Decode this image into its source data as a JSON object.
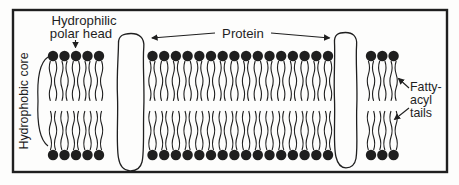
{
  "colors": {
    "ink": "#1f1f1f",
    "paper": "#fdfdfc"
  },
  "labels": {
    "hydrophilic_polar_head": {
      "line1": "Hydrophilic",
      "line2": "polar head"
    },
    "protein": "Protein",
    "hydrophobic_core": "Hydrophobic core",
    "fatty_acyl_tails": {
      "line1": "Fatty-",
      "line2": "acyl",
      "line3": "tails"
    }
  },
  "diagram": {
    "border": {
      "x": 13,
      "y": 10,
      "w": 434,
      "h": 162
    },
    "lipid": {
      "head_radius": 5.2,
      "top_head_cy": 56,
      "bottom_head_cy": 155,
      "top_tail": {
        "y1": 61,
        "y2": 101
      },
      "bottom_tail": {
        "y1": 111,
        "y2": 150
      },
      "tail_offset": 2.6
    },
    "groups": [
      {
        "id": "left",
        "start_x": 53,
        "count": 5,
        "spacing": 11.5
      },
      {
        "id": "middle",
        "start_x": 152.5,
        "count": 16,
        "spacing": 11.7
      },
      {
        "id": "right",
        "start_x": 371,
        "count": 3,
        "spacing": 11.3
      }
    ],
    "proteins": [
      {
        "id": "protein-left",
        "path": "M 131 33.5 C 124 33.5 118.5 35 118.5 43 C 118.5 55 116.5 75 117.5 97 C 118.3 118 116 145 118.5 158 C 119.8 166 123 170.5 130 170.8 C 136.5 171 140.5 168 142 162 C 144.5 152 143 128 143.8 108 C 144.6 86 142.5 62 143.8 47 C 144.6 37.5 139 33.5 131 33.5 Z"
      },
      {
        "id": "protein-right",
        "path": "M 345.5 32.5 C 338.5 32.5 334 34.5 334.5 42.5 C 335.3 55 333.5 78 334.5 100 C 335.3 120 333 145 336 157 C 337.8 164.5 341.5 167.8 346 167.8 C 351 167.8 354.8 165 356 158.5 C 358 147 356 126 356.8 106 C 357.6 84 355.5 60 356.6 45 C 357.3 36 352.5 32.5 345.5 32.5 Z"
      }
    ],
    "bracket_path": "M 48 57 C 39 63 37 80 38 101 C 37 123 40 140 48 146"
  }
}
